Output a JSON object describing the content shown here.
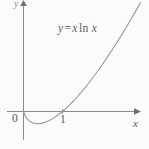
{
  "figure": {
    "background_color": "#fbfbfb",
    "line_color": "#8a8a8a",
    "curve_color": "#9a9a9a",
    "text_color": "#5f5f5f"
  },
  "labels": {
    "equation_y": "y",
    "equation_eq": "=",
    "equation_x1": "x",
    "equation_ln": "ln",
    "equation_x2": "x",
    "equation_full": "y = x ln x",
    "x_axis": "x",
    "y_axis": "y",
    "origin": "0",
    "tick_one": "1"
  },
  "chart_data": {
    "type": "line",
    "title": "",
    "subtitle": "",
    "xlabel": "x",
    "ylabel": "y",
    "annotations": [
      "y = x ln x"
    ],
    "legend": [],
    "legend_position": "none",
    "grid": false,
    "xlim": [
      -0.35,
      3.1
    ],
    "ylim": [
      -1.2,
      6.2
    ],
    "xticks": [
      0,
      1
    ],
    "xtick_labels": [
      "0",
      "1"
    ],
    "yticks": [],
    "ytick_labels": [],
    "series": [
      {
        "name": "y = x ln x",
        "color": "#9a9a9a",
        "x": [
          0.0,
          0.05,
          0.1,
          0.15,
          0.2,
          0.25,
          0.3,
          0.3679,
          0.45,
          0.55,
          0.65,
          0.75,
          0.85,
          1.0,
          1.15,
          1.3,
          1.5,
          1.7,
          1.9,
          2.1,
          2.3,
          2.5,
          2.7,
          2.9,
          3.0
        ],
        "y": [
          0.0,
          -0.15,
          -0.23,
          -0.285,
          -0.322,
          -0.347,
          -0.361,
          -0.3679,
          -0.359,
          -0.329,
          -0.28,
          -0.216,
          -0.138,
          0.0,
          0.161,
          0.341,
          0.608,
          0.902,
          1.22,
          1.558,
          1.916,
          2.291,
          2.682,
          3.088,
          3.296
        ]
      }
    ],
    "notes": {
      "x_intercepts": [
        0,
        1
      ],
      "minimum": {
        "x": 0.3679,
        "y": -0.3679
      }
    }
  }
}
